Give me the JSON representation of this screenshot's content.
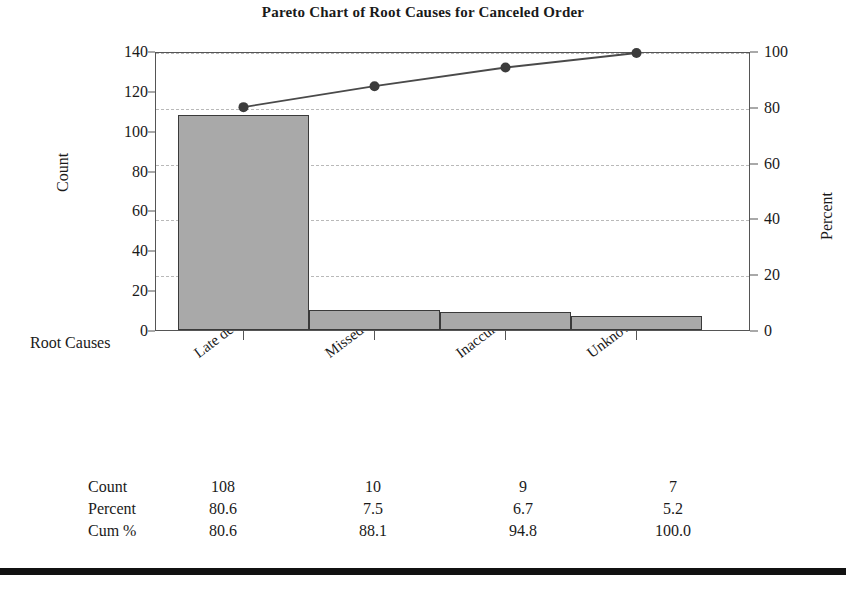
{
  "chart_data": {
    "type": "bar",
    "title": "Pareto Chart of Root Causes for Canceled Order",
    "xlabel": "Root Causes",
    "ylabel": "Count",
    "y2label": "Percent",
    "categories": [
      "Late delivery",
      "Missed schedule",
      "Inaccurate schedule",
      "Unknown"
    ],
    "values": [
      108,
      10,
      9,
      7
    ],
    "percent": [
      80.6,
      7.5,
      6.7,
      5.2
    ],
    "cumulative_percent": [
      80.6,
      88.1,
      94.8,
      100.0
    ],
    "ylim": [
      0,
      140
    ],
    "y2lim": [
      0,
      100
    ],
    "yticks": [
      0,
      20,
      40,
      60,
      80,
      100,
      120,
      140
    ],
    "y2ticks": [
      0,
      20,
      40,
      60,
      80,
      100
    ],
    "grid": true,
    "grid_axis": "percent",
    "legend": "none",
    "series": [
      {
        "name": "Count",
        "type": "bar",
        "values": [
          108,
          10,
          9,
          7
        ]
      },
      {
        "name": "Cum %",
        "type": "line",
        "values": [
          80.6,
          88.1,
          94.8,
          100.0
        ]
      }
    ],
    "colors": {
      "bar_fill": "#a9a9a9",
      "bar_edge": "#3a3a3a",
      "line": "#4a4a4a",
      "marker": "#3c3c3c",
      "grid": "#b9b9b9",
      "axis": "#555555"
    }
  },
  "axes": {
    "left": {
      "title": "Count",
      "ticks": [
        "0",
        "20",
        "40",
        "60",
        "80",
        "100",
        "120",
        "140"
      ]
    },
    "right": {
      "title": "Percent",
      "ticks": [
        "0",
        "20",
        "40",
        "60",
        "80",
        "100"
      ]
    },
    "x": {
      "title": "Root Causes",
      "categories": [
        "Late delivery",
        "Missed schedule",
        "Inaccurate schedule",
        "Unknown"
      ]
    }
  },
  "table": {
    "rows": [
      {
        "label": "Count",
        "values": [
          "108",
          "10",
          "9",
          "7"
        ]
      },
      {
        "label": "Percent",
        "values": [
          "80.6",
          "7.5",
          "6.7",
          "5.2"
        ]
      },
      {
        "label": "Cum %",
        "values": [
          "80.6",
          "88.1",
          "94.8",
          "100.0"
        ]
      }
    ]
  }
}
